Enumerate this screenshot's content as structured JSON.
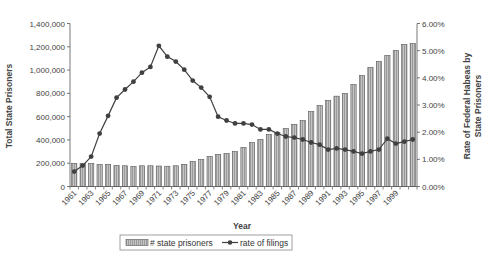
{
  "chart_data": {
    "type": "bar+line",
    "title": "",
    "xlabel": "Year",
    "ylabel_left": "Total State Prisoners",
    "ylabel_right": "Rate of Federal Habeas by State Prisoners",
    "ylim_left": [
      0,
      1400000
    ],
    "ylim_right": [
      0,
      6
    ],
    "left_ticks": [
      "0",
      "200,000",
      "400,000",
      "600,000",
      "800,000",
      "1,000,000",
      "1,200,000",
      "1,400,000"
    ],
    "right_ticks": [
      "0.00%",
      "1.00%",
      "2.00%",
      "3.00%",
      "4.00%",
      "5.00%",
      "6.00%"
    ],
    "x_tick_labels": [
      "1961",
      "1963",
      "1965",
      "1967",
      "1969",
      "1971",
      "1973",
      "1975",
      "1977",
      "1979",
      "1981",
      "1983",
      "1985",
      "1987",
      "1989",
      "1991",
      "1993",
      "1995",
      "1997",
      "1999"
    ],
    "categories": [
      1961,
      1962,
      1963,
      1964,
      1965,
      1966,
      1967,
      1968,
      1969,
      1970,
      1971,
      1972,
      1973,
      1974,
      1975,
      1976,
      1977,
      1978,
      1979,
      1980,
      1981,
      1982,
      1983,
      1984,
      1985,
      1986,
      1987,
      1988,
      1989,
      1990,
      1991,
      1992,
      1993,
      1994,
      1995,
      1996,
      1997,
      1998,
      1999,
      2000,
      2001
    ],
    "series": [
      {
        "name": "# state prisoners",
        "type": "bar",
        "axis": "left",
        "values": [
          198000,
          196000,
          197000,
          189000,
          189000,
          180000,
          178000,
          172000,
          178000,
          178000,
          176000,
          174000,
          178000,
          190000,
          215000,
          232000,
          258000,
          275000,
          283000,
          300000,
          335000,
          378000,
          404000,
          447000,
          464000,
          498000,
          533000,
          567000,
          644000,
          696000,
          739000,
          776000,
          799000,
          876000,
          953000,
          1022000,
          1074000,
          1125000,
          1168000,
          1220000,
          1228000
        ]
      },
      {
        "name": "rate of filings",
        "type": "line",
        "axis": "right",
        "unit": "%",
        "values": [
          0.55,
          0.77,
          1.1,
          1.95,
          2.6,
          3.27,
          3.57,
          3.86,
          4.19,
          4.4,
          5.18,
          4.78,
          4.6,
          4.3,
          3.9,
          3.64,
          3.3,
          2.57,
          2.43,
          2.32,
          2.32,
          2.28,
          2.1,
          2.1,
          1.95,
          1.84,
          1.8,
          1.73,
          1.62,
          1.54,
          1.36,
          1.4,
          1.36,
          1.29,
          1.21,
          1.29,
          1.36,
          1.76,
          1.58,
          1.65,
          1.73
        ]
      }
    ],
    "legend": [
      "# state prisoners",
      "rate of filings"
    ],
    "legend_position": "bottom",
    "grid": false
  },
  "colors": {
    "bar_fill": "#b5b5b5",
    "bar_stroke": "#555555",
    "line": "#404040",
    "axis": "#555555",
    "text": "#444444"
  }
}
